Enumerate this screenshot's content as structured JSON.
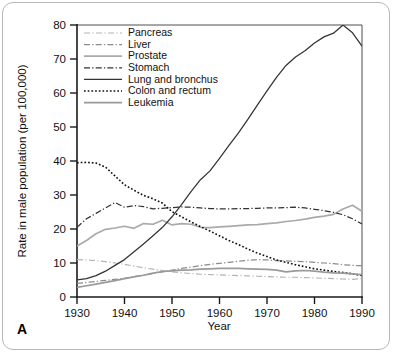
{
  "figure": {
    "panel_letter": "A"
  },
  "chart_data": {
    "type": "line",
    "title": "",
    "xlabel": "Year",
    "ylabel": "Rate in male population (per 100,000)",
    "xlim": [
      1930,
      1990
    ],
    "ylim": [
      0,
      80
    ],
    "xticks": [
      "1930",
      "1940",
      "1950",
      "1960",
      "1970",
      "1980",
      "1990"
    ],
    "yticks": [
      "0",
      "10",
      "20",
      "30",
      "40",
      "50",
      "60",
      "70",
      "80"
    ],
    "grid": false,
    "legend_position": "upper-left-inside",
    "x": [
      1930,
      1932,
      1934,
      1936,
      1938,
      1940,
      1942,
      1944,
      1946,
      1948,
      1950,
      1952,
      1954,
      1956,
      1958,
      1960,
      1962,
      1964,
      1966,
      1968,
      1970,
      1972,
      1974,
      1976,
      1978,
      1980,
      1982,
      1984,
      1986,
      1988,
      1990
    ],
    "series": [
      {
        "name": "Pancreas",
        "color": "#b3b3b3",
        "dash": "dash-dot-thin",
        "values": [
          11.0,
          10.9,
          10.7,
          10.4,
          10.0,
          9.6,
          9.1,
          8.6,
          8.2,
          7.8,
          7.4,
          7.1,
          6.9,
          6.7,
          6.6,
          6.5,
          6.4,
          6.3,
          6.2,
          6.1,
          6.0,
          5.9,
          5.8,
          5.8,
          5.7,
          5.6,
          5.5,
          5.4,
          5.3,
          5.2,
          5.4
        ]
      },
      {
        "name": "Liver",
        "color": "#8c8c8c",
        "dash": "dash-dot",
        "values": [
          4.0,
          4.3,
          4.6,
          4.9,
          5.2,
          5.5,
          6.0,
          6.4,
          6.9,
          7.4,
          7.9,
          8.4,
          8.8,
          9.2,
          9.6,
          9.9,
          10.2,
          10.5,
          10.8,
          11.0,
          10.9,
          10.7,
          10.6,
          10.5,
          10.4,
          10.2,
          10.0,
          9.8,
          9.5,
          9.3,
          9.2
        ]
      },
      {
        "name": "Prostate",
        "color": "#aaaaaa",
        "dash": "solid-gray",
        "values": [
          15.0,
          16.6,
          18.6,
          19.9,
          20.3,
          20.8,
          20.2,
          21.6,
          21.4,
          22.6,
          21.2,
          21.6,
          21.4,
          20.5,
          20.4,
          20.6,
          20.8,
          21.0,
          21.2,
          21.3,
          21.6,
          21.8,
          22.2,
          22.5,
          22.9,
          23.4,
          23.8,
          24.3,
          25.9,
          27.0,
          25.2
        ]
      },
      {
        "name": "Stomach",
        "color": "#333333",
        "dash": "dash-dot",
        "values": [
          20.5,
          23.0,
          24.6,
          26.2,
          27.8,
          26.4,
          26.9,
          26.6,
          25.9,
          26.1,
          26.3,
          26.5,
          26.4,
          26.2,
          26.0,
          25.9,
          25.9,
          26.0,
          26.0,
          26.1,
          26.2,
          26.2,
          26.3,
          26.4,
          26.2,
          25.8,
          25.4,
          24.9,
          24.2,
          23.0,
          21.5
        ]
      },
      {
        "name": "Lung and bronchus",
        "color": "#333333",
        "dash": "solid-dark",
        "values": [
          5.0,
          5.4,
          6.3,
          7.6,
          9.3,
          11.0,
          13.3,
          15.6,
          18.0,
          20.5,
          23.6,
          27.2,
          31.0,
          34.5,
          37.1,
          40.8,
          44.6,
          48.3,
          52.3,
          56.5,
          60.6,
          64.6,
          68.1,
          70.6,
          72.4,
          74.7,
          76.5,
          77.6,
          80.0,
          77.7,
          73.8
        ]
      },
      {
        "name": "Colon and rectum",
        "color": "#111111",
        "dash": "dotted",
        "values": [
          39.5,
          39.6,
          39.4,
          38.2,
          35.6,
          33.0,
          31.4,
          29.9,
          28.9,
          27.6,
          25.1,
          23.6,
          22.1,
          20.7,
          19.4,
          18.0,
          16.6,
          15.4,
          14.1,
          12.9,
          11.9,
          10.9,
          10.2,
          9.5,
          8.9,
          8.3,
          7.9,
          7.5,
          7.2,
          6.8,
          6.3
        ]
      },
      {
        "name": "Leukemia",
        "color": "#9a9a9a",
        "dash": "solid-gray",
        "values": [
          2.8,
          3.3,
          3.8,
          4.3,
          4.8,
          5.4,
          5.9,
          6.4,
          7.0,
          7.5,
          7.7,
          7.9,
          8.0,
          8.2,
          8.3,
          8.4,
          8.4,
          8.4,
          8.3,
          8.2,
          8.1,
          7.9,
          7.4,
          7.7,
          7.8,
          7.6,
          7.3,
          7.1,
          7.0,
          6.8,
          6.6
        ]
      }
    ]
  }
}
